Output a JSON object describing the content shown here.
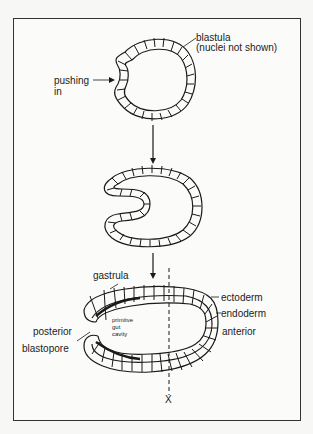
{
  "diagram": {
    "title": "",
    "stages": [
      {
        "id": "blastula",
        "label": "blastula",
        "sublabel": "(nuclei not shown)"
      },
      {
        "id": "invagination",
        "label": ""
      },
      {
        "id": "gastrula",
        "label": "gastrula"
      }
    ],
    "labels": {
      "blastula": "blastula",
      "nuclei_note": "(nuclei not shown)",
      "pushing_in_1": "pushing",
      "pushing_in_2": "in",
      "gastrula": "gastrula",
      "ectoderm": "ectoderm",
      "endoderm": "endoderm",
      "anterior": "anterior",
      "posterior": "posterior",
      "blastopore": "blastopore",
      "gut_1": "primitve",
      "gut_2": "gut",
      "gut_3": "cavity",
      "section_marker": "X"
    },
    "colors": {
      "line": "#1a1a1a",
      "background": "#fbfbf9"
    }
  }
}
